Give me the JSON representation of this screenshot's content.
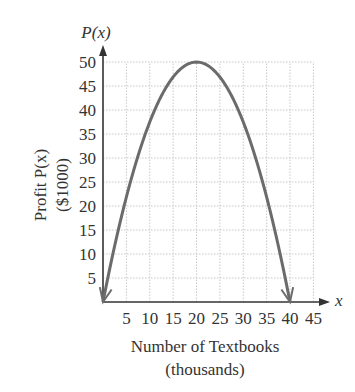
{
  "chart_data": {
    "type": "line",
    "title": "",
    "function_label": "P(x)",
    "ylabel_line1": "Profit P(x)",
    "ylabel_line2": "($1000)",
    "xlabel_line1": "Number of Textbooks",
    "xlabel_line2": "(thousands)",
    "x_axis_symbol": "x",
    "y_axis_symbol": "P(x)",
    "xlim": [
      0,
      45
    ],
    "ylim": [
      0,
      50
    ],
    "x_ticks": [
      5,
      10,
      15,
      20,
      25,
      30,
      35,
      40,
      45
    ],
    "y_ticks": [
      5,
      10,
      15,
      20,
      25,
      30,
      35,
      40,
      45,
      50
    ],
    "grid": true,
    "legend": null,
    "series": [
      {
        "name": "P(x)",
        "equation": "P(x) = -0.125x^2 + 5x",
        "vertex": [
          20,
          50
        ],
        "x_intercepts": [
          0,
          40
        ],
        "x": [
          0,
          5,
          10,
          15,
          20,
          25,
          30,
          35,
          40
        ],
        "values": [
          0,
          21.875,
          37.5,
          46.875,
          50,
          46.875,
          37.5,
          21.875,
          0
        ],
        "arrows_at_ends": true,
        "color": "#6b6b6b"
      }
    ]
  },
  "colors": {
    "axis": "#333333",
    "grid": "#c8c8c8",
    "curve": "#6b6b6b",
    "text": "#333333"
  }
}
